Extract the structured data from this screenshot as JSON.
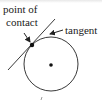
{
  "diagram": {
    "labels": {
      "point_of_contact_line1": "point of",
      "point_of_contact_line2": "contact",
      "tangent": "tangent"
    },
    "circle": {
      "cx": 51,
      "cy": 64,
      "r": 27
    },
    "center_dot": {
      "cx": 51,
      "cy": 65,
      "r": 2
    },
    "contact_point": {
      "cx": 32,
      "cy": 45,
      "r": 2.2
    },
    "tangent_line": {
      "x1": 8,
      "y1": 70,
      "x2": 55,
      "y2": 19
    },
    "colors": {
      "stroke": "#222222",
      "text": "#1a1a1a",
      "background": "#ffffff"
    }
  }
}
